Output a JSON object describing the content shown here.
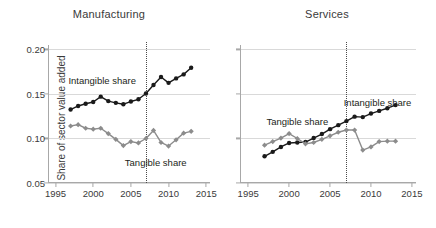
{
  "figure": {
    "ylabel": "Share of sector value added",
    "yticks": [
      0.05,
      0.1,
      0.15,
      0.2
    ],
    "ytick_labels": [
      "0.05",
      "0.10",
      "0.15",
      "0.20"
    ],
    "xticks": [
      1995,
      2000,
      2005,
      2010,
      2015
    ],
    "xtick_labels": [
      "1995",
      "2000",
      "2005",
      "2010",
      "2015"
    ],
    "reference_year": 2007,
    "colors": {
      "intangible": "#1a1a1a",
      "tangible": "#8c8c8c",
      "grid": "#d9d9d9",
      "axis": "#a8a8a8",
      "text": "#231f20",
      "background": "#ffffff"
    }
  },
  "chart_data": [
    {
      "type": "line",
      "title": "Manufacturing",
      "xlabel": "",
      "ylabel": "Share of sector value added",
      "xlim": [
        1994,
        2015.5
      ],
      "ylim": [
        0.05,
        0.205
      ],
      "grid": true,
      "legend": "annotations",
      "annotations": [
        {
          "text": "Intangible share",
          "x": 2001.2,
          "y": 0.1655,
          "align": "center"
        },
        {
          "text": "Tangible share",
          "x": 2008.3,
          "y": 0.0735,
          "align": "center"
        }
      ],
      "reference_line": {
        "x": 2007,
        "style": "dotted"
      },
      "x": [
        1997,
        1998,
        1999,
        2000,
        2001,
        2002,
        2003,
        2004,
        2005,
        2006,
        2007,
        2008,
        2009,
        2010,
        2011,
        2012,
        2013
      ],
      "series": [
        {
          "name": "Intangible share",
          "marker": "circle",
          "color": "#1a1a1a",
          "values": [
            0.1325,
            0.1365,
            0.139,
            0.141,
            0.147,
            0.142,
            0.14,
            0.1385,
            0.1415,
            0.144,
            0.1505,
            0.16,
            0.169,
            0.1625,
            0.1675,
            0.172,
            0.1795
          ]
        },
        {
          "name": "Tangible share",
          "marker": "diamond",
          "color": "#8c8c8c",
          "values": [
            0.114,
            0.1155,
            0.1115,
            0.1105,
            0.1115,
            0.1055,
            0.099,
            0.092,
            0.0965,
            0.095,
            0.1,
            0.109,
            0.0955,
            0.0915,
            0.0985,
            0.106,
            0.108
          ]
        }
      ]
    },
    {
      "type": "line",
      "title": "Services",
      "xlabel": "",
      "ylabel": "",
      "xlim": [
        1994,
        2015.5
      ],
      "ylim": [
        0.05,
        0.205
      ],
      "grid": true,
      "legend": "annotations",
      "annotations": [
        {
          "text": "Tangible share",
          "x": 2001.0,
          "y": 0.1195,
          "align": "center"
        },
        {
          "text": "Intangible share",
          "x": 2010.8,
          "y": 0.141,
          "align": "center"
        }
      ],
      "reference_line": {
        "x": 2007,
        "style": "dotted"
      },
      "x": [
        1997,
        1998,
        1999,
        2000,
        2001,
        2002,
        2003,
        2004,
        2005,
        2006,
        2007,
        2008,
        2009,
        2010,
        2011,
        2012,
        2013
      ],
      "series": [
        {
          "name": "Intangible share",
          "marker": "circle",
          "color": "#1a1a1a",
          "values": [
            0.08,
            0.085,
            0.0905,
            0.095,
            0.0955,
            0.096,
            0.1005,
            0.105,
            0.1105,
            0.115,
            0.1195,
            0.1245,
            0.124,
            0.128,
            0.131,
            0.134,
            0.1375
          ]
        },
        {
          "name": "Tangible share",
          "marker": "diamond",
          "color": "#8c8c8c",
          "values": [
            0.0925,
            0.0965,
            0.1005,
            0.1055,
            0.1,
            0.094,
            0.0955,
            0.099,
            0.103,
            0.107,
            0.1095,
            0.1095,
            0.087,
            0.0905,
            0.0965,
            0.097,
            0.097
          ]
        }
      ]
    }
  ]
}
